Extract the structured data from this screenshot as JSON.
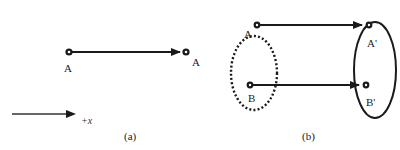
{
  "panel_a": {
    "caption": "(a)",
    "start_label": "A",
    "end_label": "A",
    "axis_label": "+x"
  },
  "panel_b": {
    "caption": "(b)",
    "labels": {
      "a": "A",
      "b": "B",
      "a_prime": "A'",
      "b_prime": "B'"
    },
    "source_set_style": "dotted",
    "target_set_style": "solid"
  },
  "colors": {
    "ink": "#1a1a1a",
    "background": "#ffffff"
  }
}
